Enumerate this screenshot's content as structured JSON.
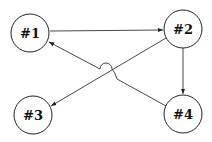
{
  "diagram": {
    "type": "directed-graph",
    "nodes": [
      {
        "id": "n1",
        "label": "#1",
        "cx": 30,
        "cy": 33,
        "r": 19
      },
      {
        "id": "n2",
        "label": "#2",
        "cx": 183,
        "cy": 29,
        "r": 19
      },
      {
        "id": "n3",
        "label": "#3",
        "cx": 33,
        "cy": 115,
        "r": 19
      },
      {
        "id": "n4",
        "label": "#4",
        "cx": 183,
        "cy": 114,
        "r": 19
      }
    ],
    "edges": [
      {
        "from": "#1",
        "to": "#2"
      },
      {
        "from": "#2",
        "to": "#4"
      },
      {
        "from": "#2",
        "to": "#3"
      },
      {
        "from": "#4",
        "to": "#1",
        "note": "hops over #2→#3 edge"
      }
    ],
    "colors": {
      "stroke": "#222222",
      "background": "#ffffff"
    }
  }
}
